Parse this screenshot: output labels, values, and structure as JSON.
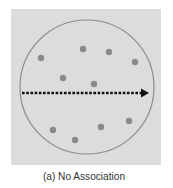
{
  "figure": {
    "caption": "(a) No Association",
    "panel_color": "#dcdcdc",
    "circle": {
      "cx": 87,
      "cy": 87,
      "r": 67,
      "stroke": "#8c8c8c"
    },
    "dot_color": "#8a8a8a",
    "dots": [
      {
        "x": 41,
        "y": 58
      },
      {
        "x": 83,
        "y": 49
      },
      {
        "x": 109,
        "y": 52
      },
      {
        "x": 135,
        "y": 62
      },
      {
        "x": 63,
        "y": 78
      },
      {
        "x": 94,
        "y": 84
      },
      {
        "x": 53,
        "y": 130
      },
      {
        "x": 75,
        "y": 140
      },
      {
        "x": 101,
        "y": 127
      },
      {
        "x": 129,
        "y": 121
      }
    ],
    "arrow": {
      "x1": 22,
      "y": 93,
      "x2": 149,
      "color": "#111111",
      "style": "dotted"
    }
  }
}
